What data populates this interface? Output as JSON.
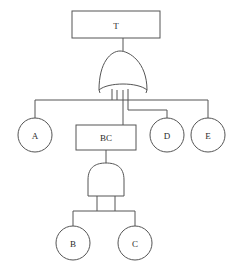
{
  "diagram": {
    "stroke_color": "#555555",
    "fill_color": "#ffffff",
    "text_color": "#2b2b2b",
    "background": "#ffffff",
    "nodes": {
      "top_event": {
        "label": "T",
        "type": "rectangle-event"
      },
      "intermediate_event": {
        "label": "BC",
        "type": "rectangle-event"
      },
      "basic_a": {
        "label": "A",
        "type": "circle-basic-event"
      },
      "basic_d": {
        "label": "D",
        "type": "circle-basic-event"
      },
      "basic_e": {
        "label": "E",
        "type": "circle-basic-event"
      },
      "basic_b": {
        "label": "B",
        "type": "circle-basic-event"
      },
      "basic_c": {
        "label": "C",
        "type": "circle-basic-event"
      }
    },
    "gates": {
      "or_gate": {
        "name": "or-gate",
        "inputs": [
          "A",
          "BC",
          "D",
          "E"
        ],
        "output": "T"
      },
      "and_gate": {
        "name": "and-gate",
        "inputs": [
          "B",
          "C"
        ],
        "output": "BC"
      }
    }
  }
}
